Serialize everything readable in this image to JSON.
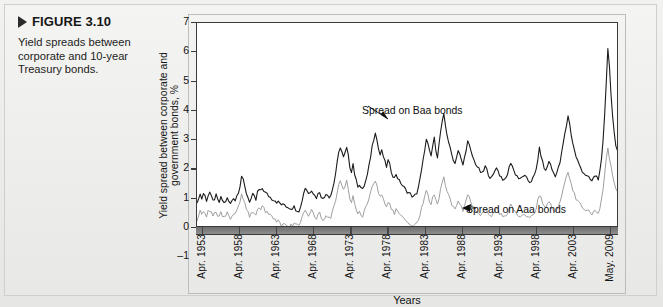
{
  "figure": {
    "marker_icon": "triangle-right-icon",
    "label": "FIGURE 3.10",
    "caption": "Yield spreads between corporate and 10-year Treasury bonds."
  },
  "chart_data": {
    "type": "line",
    "title": "",
    "xlabel": "Years",
    "ylabel": "Yield spread between corporate and government bonds, %",
    "ylim": [
      -1,
      7
    ],
    "yticks": [
      7,
      6,
      5,
      4,
      3,
      2,
      1,
      0,
      -1
    ],
    "grid": false,
    "legend_position": "inline-annotations",
    "annotations": [
      {
        "text": "Spread on Baa bonds",
        "target_series": "Spread on Baa bonds",
        "x": "Apr. 1980",
        "y": 3.05
      },
      {
        "text": "Spread on Aaa bonds",
        "target_series": "Spread on Aaa bonds",
        "x": "Apr. 1990",
        "y": 0.6
      }
    ],
    "xticks": [
      "Apr. 1953",
      "Apr. 1958",
      "Apr. 1963",
      "Apr. 1968",
      "Apr. 1973",
      "Apr. 1978",
      "Apr. 1983",
      "Apr. 1988",
      "Apr. 1993",
      "Apr. 1998",
      "Apr. 2003",
      "May. 2009"
    ],
    "x_start": "Apr. 1953",
    "x_end": "May. 2009",
    "series": [
      {
        "name": "Spread on Baa bonds",
        "color": "#1c1c1c",
        "values": [
          0.8,
          1.05,
          1.15,
          1.0,
          1.18,
          1.1,
          0.95,
          1.12,
          1.22,
          1.05,
          0.92,
          1.0,
          1.1,
          0.95,
          0.88,
          1.02,
          0.95,
          0.85,
          0.92,
          1.0,
          0.9,
          0.82,
          0.95,
          1.05,
          0.95,
          1.1,
          1.25,
          1.45,
          1.78,
          1.62,
          1.4,
          1.2,
          1.05,
          0.92,
          1.0,
          1.12,
          1.05,
          0.95,
          1.22,
          1.3,
          1.25,
          1.35,
          1.28,
          1.2,
          1.15,
          1.1,
          1.05,
          1.0,
          0.98,
          0.95,
          0.9,
          0.88,
          0.85,
          0.8,
          0.78,
          0.8,
          0.75,
          0.72,
          0.7,
          0.68,
          0.7,
          0.72,
          0.65,
          0.62,
          0.6,
          0.7,
          0.95,
          1.2,
          1.38,
          1.3,
          1.18,
          1.25,
          1.32,
          1.2,
          1.1,
          1.05,
          1.15,
          1.25,
          1.1,
          0.98,
          1.05,
          1.2,
          1.15,
          1.08,
          1.12,
          1.3,
          1.55,
          1.85,
          2.2,
          2.55,
          2.78,
          2.6,
          2.4,
          2.55,
          2.72,
          2.45,
          2.1,
          1.95,
          2.2,
          1.85,
          1.6,
          1.45,
          1.5,
          1.38,
          1.3,
          1.45,
          1.62,
          1.8,
          2.1,
          2.45,
          2.8,
          3.05,
          3.3,
          3.0,
          2.7,
          2.5,
          2.62,
          2.45,
          2.25,
          2.1,
          2.3,
          2.15,
          1.95,
          1.8,
          1.7,
          1.85,
          1.72,
          1.6,
          1.55,
          1.45,
          1.38,
          1.3,
          1.25,
          1.2,
          1.15,
          1.1,
          1.05,
          1.12,
          1.2,
          1.4,
          1.65,
          1.95,
          2.3,
          2.7,
          3.0,
          2.85,
          2.6,
          2.45,
          2.8,
          3.05,
          2.7,
          2.45,
          2.85,
          3.3,
          3.6,
          3.85,
          3.5,
          3.2,
          2.95,
          2.7,
          2.5,
          2.35,
          2.2,
          2.45,
          2.65,
          2.5,
          2.3,
          2.15,
          2.4,
          2.7,
          2.95,
          2.8,
          2.6,
          2.45,
          2.3,
          2.2,
          2.1,
          2.0,
          1.92,
          1.85,
          1.95,
          2.1,
          1.98,
          1.85,
          1.75,
          1.7,
          1.8,
          1.95,
          2.1,
          1.95,
          1.82,
          1.75,
          1.68,
          1.6,
          1.7,
          1.85,
          2.05,
          2.25,
          2.12,
          1.95,
          1.85,
          1.78,
          1.7,
          1.65,
          1.72,
          1.8,
          1.75,
          1.68,
          1.62,
          1.58,
          1.62,
          1.7,
          1.8,
          2.0,
          2.35,
          2.7,
          2.5,
          2.25,
          2.05,
          1.95,
          2.1,
          2.3,
          2.15,
          1.98,
          1.88,
          1.8,
          1.9,
          2.05,
          2.25,
          2.55,
          2.9,
          3.2,
          3.5,
          3.85,
          3.55,
          3.2,
          2.9,
          2.65,
          2.45,
          2.3,
          2.15,
          2.05,
          1.95,
          1.88,
          1.82,
          1.75,
          1.7,
          1.65,
          1.6,
          1.7,
          1.8,
          1.75,
          1.7,
          1.9,
          2.3,
          2.95,
          3.9,
          5.0,
          6.15,
          5.5,
          4.6,
          3.8,
          3.2,
          2.75,
          2.65,
          2.58
        ]
      },
      {
        "name": "Spread on Aaa bonds",
        "color": "#9a9a9a",
        "values": [
          0.28,
          0.45,
          0.55,
          0.48,
          0.6,
          0.52,
          0.42,
          0.55,
          0.62,
          0.5,
          0.4,
          0.48,
          0.55,
          0.45,
          0.38,
          0.5,
          0.45,
          0.35,
          0.42,
          0.5,
          0.4,
          0.32,
          0.45,
          0.52,
          0.45,
          0.58,
          0.7,
          0.88,
          1.18,
          1.02,
          0.82,
          0.65,
          0.52,
          0.4,
          0.48,
          0.58,
          0.5,
          0.42,
          0.62,
          0.7,
          0.65,
          0.72,
          0.66,
          0.58,
          0.52,
          0.48,
          0.42,
          0.38,
          0.35,
          0.3,
          0.26,
          0.22,
          0.18,
          0.12,
          0.08,
          0.1,
          0.05,
          0.02,
          0.05,
          0.08,
          0.12,
          0.15,
          0.1,
          0.08,
          0.12,
          0.22,
          0.38,
          0.52,
          0.62,
          0.55,
          0.45,
          0.52,
          0.58,
          0.48,
          0.4,
          0.35,
          0.42,
          0.5,
          0.38,
          0.28,
          0.32,
          0.45,
          0.4,
          0.32,
          0.38,
          0.52,
          0.72,
          0.95,
          1.2,
          1.45,
          1.62,
          1.48,
          1.32,
          1.45,
          1.58,
          1.35,
          1.05,
          0.92,
          1.12,
          0.85,
          0.65,
          0.52,
          0.58,
          0.48,
          0.42,
          0.55,
          0.7,
          0.85,
          1.05,
          1.25,
          1.42,
          1.52,
          1.58,
          1.4,
          1.22,
          1.08,
          1.15,
          1.02,
          0.88,
          0.78,
          0.92,
          0.82,
          0.68,
          0.58,
          0.5,
          0.62,
          0.52,
          0.45,
          0.4,
          0.34,
          0.3,
          0.25,
          0.22,
          0.18,
          0.14,
          0.1,
          0.08,
          0.12,
          0.2,
          0.32,
          0.48,
          0.68,
          0.9,
          1.1,
          1.25,
          1.12,
          0.92,
          0.8,
          1.02,
          1.18,
          0.95,
          0.78,
          1.05,
          1.38,
          1.58,
          1.72,
          1.48,
          1.28,
          1.1,
          0.95,
          0.82,
          0.72,
          0.65,
          0.82,
          0.95,
          0.85,
          0.7,
          0.6,
          0.78,
          0.98,
          1.12,
          1.02,
          0.88,
          0.78,
          0.68,
          0.62,
          0.58,
          0.52,
          0.48,
          0.45,
          0.52,
          0.62,
          0.55,
          0.48,
          0.42,
          0.4,
          0.48,
          0.58,
          0.68,
          0.58,
          0.5,
          0.45,
          0.4,
          0.35,
          0.42,
          0.52,
          0.65,
          0.78,
          0.7,
          0.58,
          0.52,
          0.48,
          0.44,
          0.4,
          0.45,
          0.5,
          0.47,
          0.43,
          0.4,
          0.38,
          0.42,
          0.48,
          0.55,
          0.7,
          0.92,
          1.15,
          1.02,
          0.86,
          0.74,
          0.68,
          0.78,
          0.92,
          0.82,
          0.7,
          0.64,
          0.6,
          0.68,
          0.78,
          0.92,
          1.12,
          1.35,
          1.55,
          1.72,
          1.92,
          1.72,
          1.5,
          1.3,
          1.14,
          1.02,
          0.92,
          0.84,
          0.78,
          0.72,
          0.68,
          0.64,
          0.6,
          0.56,
          0.52,
          0.48,
          0.55,
          0.62,
          0.58,
          0.55,
          0.7,
          0.95,
          1.35,
          1.85,
          2.35,
          2.72,
          2.4,
          2.05,
          1.72,
          1.48,
          1.3,
          1.25,
          1.22
        ]
      }
    ]
  }
}
